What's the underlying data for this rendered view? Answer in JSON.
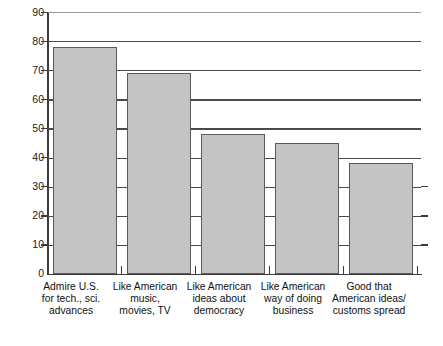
{
  "chart_data": {
    "type": "bar",
    "title": "",
    "subtitle": "",
    "xlabel": "",
    "ylabel": "",
    "ylim": [
      0,
      90
    ],
    "yticks": [
      0,
      10,
      20,
      30,
      40,
      50,
      60,
      70,
      80,
      90
    ],
    "ytick_labels": [
      "0",
      "10",
      "20",
      "30",
      "40",
      "50",
      "60",
      "70",
      "80",
      "90"
    ],
    "grid": true,
    "grid_axis": "y",
    "legend": null,
    "orientation": "vertical",
    "bar_color": "#c4c4c4",
    "bar_edge_color": "#5a5a5a",
    "axis_color": "#3b3b3b",
    "background": "#ffffff",
    "categories": [
      "Admire U.S.\nfor tech., sci.\nadvances",
      "Like American\nmusic,\nmovies, TV",
      "Like American\nideas about\ndemocracy",
      "Like American\nway of doing\nbusiness",
      "Good that\nAmerican ideas/\ncustoms spread"
    ],
    "values": [
      78,
      69,
      48,
      45,
      38
    ],
    "annotations": []
  }
}
